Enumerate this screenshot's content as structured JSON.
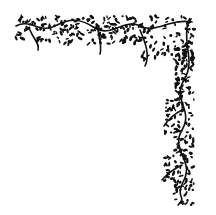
{
  "image": {
    "description": "Decorative corner ornament of black vines and leaves",
    "colors": {
      "ink": "#111111",
      "background": "#ffffff"
    }
  }
}
